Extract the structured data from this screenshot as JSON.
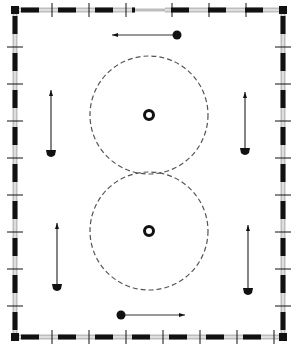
{
  "diagram": {
    "title": "",
    "colors": {
      "background": "#ffffff",
      "ink": "#111111",
      "fence_light": "#bdbdbd",
      "circle_dash": "#555555"
    },
    "arena": {
      "x": 15,
      "y": 10,
      "width": 268,
      "height": 327,
      "top_gap": [
        135,
        165
      ]
    },
    "figure_eight": {
      "circles": [
        {
          "id": "top-circle",
          "cx": 149,
          "cy": 115,
          "r": 59
        },
        {
          "id": "bottom-circle",
          "cx": 149,
          "cy": 231,
          "r": 59
        }
      ],
      "center_markers": [
        {
          "id": "top-center-marker",
          "cx": 149,
          "cy": 115
        },
        {
          "id": "bottom-center-marker",
          "cx": 149,
          "cy": 231
        }
      ]
    },
    "arrows": [
      {
        "id": "arrow-top",
        "x1": 177,
        "y1": 35,
        "x2": 112,
        "y2": 35,
        "direction": "left"
      },
      {
        "id": "arrow-bottom",
        "x1": 121,
        "y1": 315,
        "x2": 185,
        "y2": 315,
        "direction": "right"
      },
      {
        "id": "arrow-left-upper",
        "x1": 51,
        "y1": 152,
        "x2": 51,
        "y2": 90,
        "direction": "up"
      },
      {
        "id": "arrow-left-lower",
        "x1": 57,
        "y1": 286,
        "x2": 57,
        "y2": 223,
        "direction": "up"
      },
      {
        "id": "arrow-right-upper",
        "x1": 245,
        "y1": 150,
        "x2": 245,
        "y2": 92,
        "direction": "up"
      },
      {
        "id": "arrow-right-lower",
        "x1": 248,
        "y1": 290,
        "x2": 248,
        "y2": 225,
        "direction": "up"
      }
    ]
  }
}
